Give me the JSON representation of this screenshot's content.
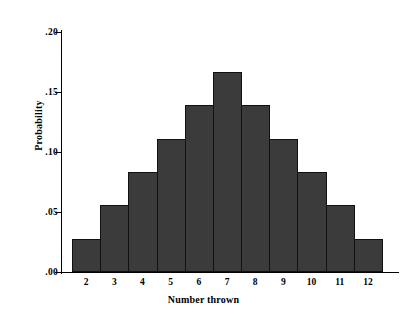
{
  "chart_data": {
    "type": "bar",
    "title": "",
    "xlabel": "Number thrown",
    "ylabel": "Probability",
    "categories": [
      "2",
      "3",
      "4",
      "5",
      "6",
      "7",
      "8",
      "9",
      "10",
      "11",
      "12"
    ],
    "values": [
      0.0278,
      0.0556,
      0.0833,
      0.1111,
      0.1389,
      0.1667,
      0.1389,
      0.1111,
      0.0833,
      0.0556,
      0.0278
    ],
    "ylim": [
      0.0,
      0.2
    ],
    "xlim_categories": [
      "2",
      "12"
    ],
    "ytick_labels": [
      ".00",
      ".05",
      ".10",
      ".15",
      ".20"
    ],
    "ytick_values": [
      0.0,
      0.05,
      0.1,
      0.15,
      0.2
    ],
    "grid": false,
    "legend": null,
    "bar_color": "#3b3b3b",
    "bar_edge_color": "#111111",
    "axis_color": "#000000",
    "background_color": "#ffffff"
  }
}
